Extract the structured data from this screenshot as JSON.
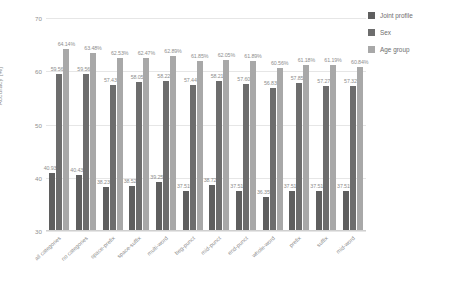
{
  "chart_data": {
    "type": "bar",
    "title": "",
    "xlabel": "",
    "ylabel": "Accuracy [%]",
    "ylim": [
      30,
      70
    ],
    "yticks": [
      30,
      40,
      50,
      60,
      70
    ],
    "grid": true,
    "legend_position": "right",
    "value_label_suffix": "%",
    "categories": [
      "all categories",
      "no categories",
      "space-prefix",
      "space-suffix",
      "multi-word",
      "beg-punct",
      "mid-punct",
      "end-punct",
      "whole-word",
      "prefix",
      "suffix",
      "mid-word"
    ],
    "series": [
      {
        "name": "Joint profile",
        "color": "#5f5f5f",
        "values": [
          40.93,
          40.43,
          38.23,
          38.52,
          39.25,
          37.51,
          38.72,
          37.51,
          36.35,
          37.51,
          37.51,
          37.51
        ],
        "labels": [
          "40.93%",
          "40.43%",
          "38.23%",
          "38.52%",
          "39.25%",
          "37.51%",
          "38.72%",
          "37.51%",
          "36.35%",
          "37.51%",
          "37.51%",
          "37.51%"
        ]
      },
      {
        "name": "Sex",
        "color": "#6d6d6d",
        "values": [
          59.56,
          59.56,
          57.43,
          58.05,
          58.22,
          57.44,
          58.21,
          57.6,
          56.83,
          57.85,
          57.27,
          57.32
        ],
        "labels": [
          "59.56%",
          "59.56%",
          "57.43%",
          "58.05%",
          "58.22%",
          "57.44%",
          "58.21%",
          "57.60%",
          "56.83%",
          "57.85%",
          "57.27%",
          "57.32%"
        ]
      },
      {
        "name": "Age group",
        "color": "#a8a8a8",
        "values": [
          64.14,
          63.48,
          62.53,
          62.47,
          62.89,
          61.85,
          62.05,
          61.89,
          60.56,
          61.18,
          61.19,
          60.84
        ],
        "labels": [
          "64.14%",
          "63.48%",
          "62.53%",
          "62.47%",
          "62.89%",
          "61.85%",
          "62.05%",
          "61.89%",
          "60.56%",
          "61.18%",
          "61.19%",
          "60.84%"
        ]
      }
    ]
  },
  "legend": {
    "items": [
      {
        "label": "Joint profile"
      },
      {
        "label": "Sex"
      },
      {
        "label": "Age group"
      }
    ]
  },
  "axes": {
    "y_title": "Accuracy [%]",
    "y_ticks": [
      "70",
      "60",
      "50",
      "40",
      "30"
    ]
  }
}
